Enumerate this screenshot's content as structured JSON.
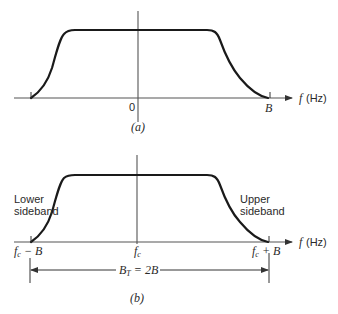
{
  "figure": {
    "panel_a": {
      "caption": "(a)",
      "x_axis_label_f": "f",
      "x_axis_label_unit": "(Hz)",
      "origin_label": "0",
      "right_edge_label": "B",
      "description": "Baseband spectrum of bandwidth B, centered at 0"
    },
    "panel_b": {
      "caption": "(b)",
      "x_axis_label_f": "f",
      "x_axis_label_unit": "(Hz)",
      "lower_sideband_line1": "Lower",
      "lower_sideband_line2": "sideband",
      "upper_sideband_line1": "Upper",
      "upper_sideband_line2": "sideband",
      "left_edge_label_f": "f",
      "left_edge_label_sub": "c",
      "left_edge_label_rest": " − B",
      "center_label_f": "f",
      "center_label_sub": "c",
      "right_edge_label_f": "f",
      "right_edge_label_sub": "c",
      "right_edge_label_rest": " + B",
      "bandwidth_label_B": "B",
      "bandwidth_label_sub": "T",
      "bandwidth_label_rest": " = 2B",
      "description": "DSB modulated spectrum centered at fc with transmission bandwidth BT = 2B"
    },
    "colors": {
      "curve": "#1a1a1a",
      "axis": "#555555",
      "text": "#2a2a2a",
      "background": "#ffffff"
    }
  }
}
